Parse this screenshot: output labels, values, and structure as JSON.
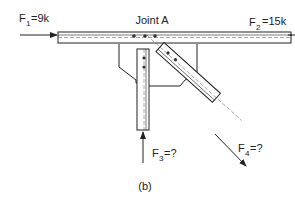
{
  "diagram": {
    "title": "Joint A",
    "caption": "(b)",
    "forces": [
      {
        "id": "F1",
        "symbol": "F",
        "subscript": "1",
        "value": "=9k"
      },
      {
        "id": "F2",
        "symbol": "F",
        "subscript": "2",
        "value": "=15k"
      },
      {
        "id": "F3",
        "symbol": "F",
        "subscript": "3",
        "value": "=?"
      },
      {
        "id": "F4",
        "symbol": "F",
        "subscript": "4",
        "value": "=?"
      }
    ],
    "colors": {
      "line": "#222222",
      "background": "#ffffff"
    }
  }
}
